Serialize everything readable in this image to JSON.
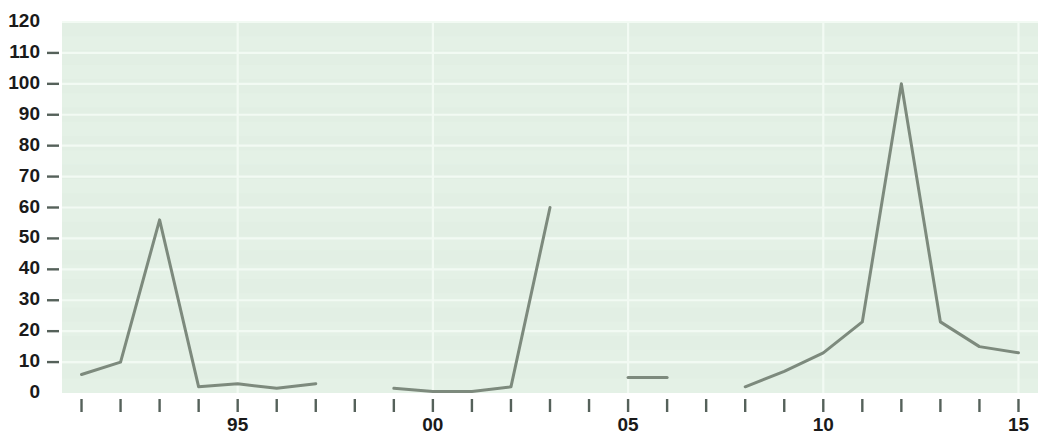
{
  "chart_data": {
    "type": "line",
    "title": "",
    "subtitle": "",
    "xlabel": "",
    "ylabel": "",
    "xlim": [
      1990.5,
      2015.5
    ],
    "ylim": [
      0,
      120
    ],
    "grid": true,
    "legend": null,
    "background_color": "#e3f0e5",
    "gridline_color": "#f2faf3",
    "line_color": "#7d8a7d",
    "line_width": 3.0,
    "y_ticks": [
      0,
      10,
      20,
      30,
      40,
      50,
      60,
      70,
      80,
      90,
      100,
      110,
      120
    ],
    "y_tick_labels": [
      "0",
      "10",
      "20",
      "30",
      "40",
      "50",
      "60",
      "70",
      "80",
      "90",
      "100",
      "110",
      "120"
    ],
    "y_ticks_with_dash": [
      10,
      20,
      30,
      40,
      50,
      60,
      70,
      80,
      90,
      100,
      110
    ],
    "x_ticks": [
      1991,
      1992,
      1993,
      1994,
      1995,
      1996,
      1997,
      1998,
      1999,
      2000,
      2001,
      2002,
      2003,
      2004,
      2005,
      2006,
      2007,
      2008,
      2009,
      2010,
      2011,
      2012,
      2013,
      2014,
      2015
    ],
    "x_tick_labels": [
      {
        "x": 1995,
        "label": "95"
      },
      {
        "x": 2000,
        "label": "00"
      },
      {
        "x": 2005,
        "label": "05"
      },
      {
        "x": 2010,
        "label": "10"
      },
      {
        "x": 2015,
        "label": "15"
      }
    ],
    "series": [
      {
        "name": "segment-1",
        "x": [
          1991,
          1992,
          1993,
          1994,
          1995,
          1996,
          1997
        ],
        "values": [
          6,
          10,
          56,
          2,
          3,
          1.5,
          3
        ]
      },
      {
        "name": "segment-2",
        "x": [
          1999,
          2000,
          2001,
          2002,
          2003
        ],
        "values": [
          1.5,
          0.5,
          0.5,
          2,
          60
        ]
      },
      {
        "name": "segment-3",
        "x": [
          2005,
          2006
        ],
        "values": [
          5,
          5
        ]
      },
      {
        "name": "segment-4",
        "x": [
          2008,
          2009,
          2010,
          2011,
          2012,
          2013,
          2014,
          2015
        ],
        "values": [
          2,
          7,
          13,
          23,
          100,
          23,
          15,
          13
        ]
      }
    ]
  }
}
